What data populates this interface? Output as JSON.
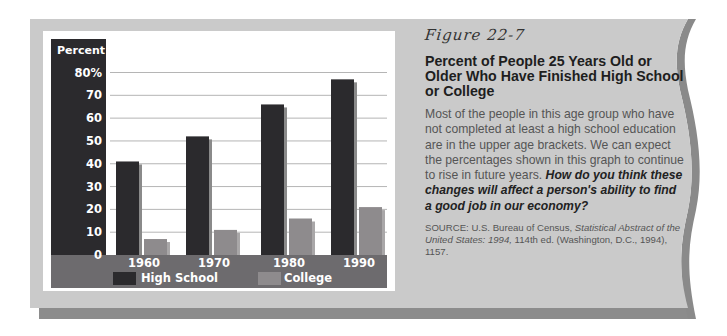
{
  "figure": {
    "label": "Figure 22-7",
    "title": "Percent of People 25 Years Old or Older Who Have Finished High School or College",
    "body": "Most of the people in this age group who have not completed at least a high school education are in the upper age brackets. We can expect the percentages shown in this graph to continue to rise in future years.",
    "question": "How do you think these changes will affect a person's ability to find a good job in our economy?",
    "source": {
      "prefix": "SOURCE: U.S. Bureau of Census, ",
      "title": "Statistical Abstract of the United States: 1994,",
      "suffix": " 114th ed. (Washington, D.C., 1994), 1157."
    }
  },
  "colors": {
    "frame": "#c9c9c9",
    "frame_shadow": "#8a8a8a",
    "high_school": "#2b2a2d",
    "college": "#8e8b8d",
    "band": "#6d6b6e",
    "grid": "#b5b5b5"
  },
  "chart_data": {
    "type": "bar",
    "title": "Percent of People 25 Years Old or Older Who Have Finished High School or College",
    "ylabel": "Percent",
    "xlabel": "",
    "ylim": [
      0,
      80
    ],
    "yticks": [
      0,
      10,
      20,
      30,
      40,
      50,
      60,
      70,
      80
    ],
    "ytick_labels": [
      "0",
      "10",
      "20",
      "30",
      "40",
      "50",
      "60",
      "70",
      "80%"
    ],
    "grid": true,
    "categories": [
      "1960",
      "1970",
      "1980",
      "1990"
    ],
    "series": [
      {
        "name": "High School",
        "values": [
          41,
          52,
          66,
          77
        ]
      },
      {
        "name": "College",
        "values": [
          7,
          11,
          16,
          21
        ]
      }
    ],
    "legend": {
      "placement": "bottom",
      "entries": [
        "High School",
        "College"
      ]
    }
  }
}
